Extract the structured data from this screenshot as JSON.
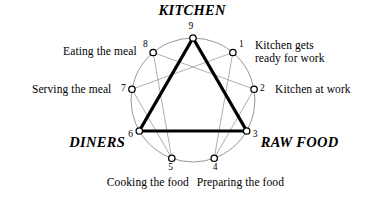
{
  "diagram": {
    "type": "enneagram",
    "title_nodes": [
      {
        "id": "kitchen",
        "text": "KITCHEN",
        "point": 9
      },
      {
        "id": "raw-food",
        "text": "RAW FOOD",
        "point": 3
      },
      {
        "id": "diners",
        "text": "DINERS",
        "point": 6
      }
    ],
    "points": [
      {
        "number": "1",
        "label": "Kitchen gets\nready for work",
        "angle_deg": -50,
        "label_side": "right"
      },
      {
        "number": "2",
        "label": "Kitchen at work",
        "angle_deg": -10,
        "label_side": "right"
      },
      {
        "number": "3",
        "label": "",
        "angle_deg": 30,
        "label_side": "right"
      },
      {
        "number": "4",
        "label": "Preparing the food",
        "angle_deg": 70,
        "label_side": "below"
      },
      {
        "number": "5",
        "label": "Cooking the food",
        "angle_deg": 110,
        "label_side": "below"
      },
      {
        "number": "6",
        "label": "",
        "angle_deg": 150,
        "label_side": "left"
      },
      {
        "number": "7",
        "label": "Serving the meal",
        "angle_deg": 190,
        "label_side": "left"
      },
      {
        "number": "8",
        "label": "Eating the meal",
        "angle_deg": 230,
        "label_side": "left"
      },
      {
        "number": "9",
        "label": "",
        "angle_deg": 270,
        "label_side": "above"
      }
    ],
    "triangle_points": [
      9,
      3,
      6
    ],
    "hexagram_sequence": [
      1,
      4,
      2,
      8,
      5,
      7
    ],
    "geometry": {
      "center_x": 193,
      "center_y": 100,
      "radius": 62,
      "node_marker_radius": 3.2
    },
    "colors": {
      "circle_stroke": "#8a8a8a",
      "hexagram_stroke": "#9a9a9a",
      "triangle_stroke": "#000000",
      "node_stroke": "#000000",
      "node_fill": "#ffffff",
      "text": "#000000",
      "background": "#ffffff"
    },
    "stroke_widths": {
      "circle": 0.9,
      "hexagram": 0.8,
      "triangle": 3.2,
      "node": 1.3
    }
  }
}
